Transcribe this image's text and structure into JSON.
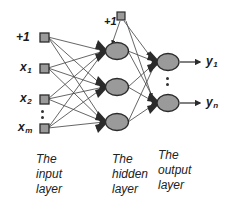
{
  "diagram": {
    "colors": {
      "node_fill": "#9a9a9a",
      "node_stroke": "#2b2b2b",
      "edge": "#4a4a4a",
      "text": "#1a1a1a",
      "background": "#ffffff"
    },
    "input_layer": {
      "caption": "The\ninput\nlayer",
      "nodes": [
        {
          "id": "in-bias",
          "label": "+1",
          "sub": "",
          "x": 42,
          "y": 37
        },
        {
          "id": "in-x1",
          "label": "x",
          "sub": "1",
          "x": 42,
          "y": 68
        },
        {
          "id": "in-x2",
          "label": "x",
          "sub": "2",
          "x": 42,
          "y": 99
        },
        {
          "id": "in-xm",
          "label": "x",
          "sub": "m",
          "x": 42,
          "y": 128
        }
      ],
      "ellipsis": {
        "x": 42,
        "y": 110
      },
      "caption_x": 36,
      "caption_y": 155
    },
    "hidden_layer": {
      "caption": "The\nhidden\nlayer",
      "bias": {
        "id": "hid-bias",
        "label": "+1",
        "x": 121,
        "y": 15
      },
      "nodes": [
        {
          "id": "h1",
          "x": 115,
          "y": 51
        },
        {
          "id": "h2",
          "x": 115,
          "y": 87
        },
        {
          "id": "h3",
          "x": 115,
          "y": 122
        }
      ],
      "caption_x": 112,
      "caption_y": 155
    },
    "output_layer": {
      "caption": "The\noutput\nlayer",
      "nodes": [
        {
          "id": "o1",
          "label": "y",
          "sub": "1",
          "x": 166,
          "y": 62
        },
        {
          "id": "on",
          "label": "y",
          "sub": "n",
          "x": 166,
          "y": 103
        }
      ],
      "ellipsis": {
        "x": 166,
        "y": 80
      },
      "caption_x": 158,
      "caption_y": 155
    },
    "output_labels": [
      {
        "label": "y",
        "sub": "1",
        "x": 207,
        "y": 56
      },
      {
        "label": "y",
        "sub": "n",
        "x": 207,
        "y": 97
      }
    ]
  }
}
